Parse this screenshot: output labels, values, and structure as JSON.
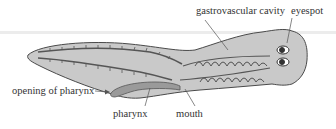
{
  "diagram": {
    "labels": {
      "gastrovascular_cavity": "gastrovascular cavity",
      "eyespot": "eyespot",
      "opening_of_pharynx": "opening of pharynx",
      "pharynx": "pharynx",
      "mouth": "mouth"
    },
    "colors": {
      "body_fill": "#c9c9c9",
      "body_outline": "#4a4a4a",
      "pharynx_fill": "#9a9a9a",
      "text": "#333333",
      "leader_line": "#555555",
      "band": "#ececec"
    }
  }
}
